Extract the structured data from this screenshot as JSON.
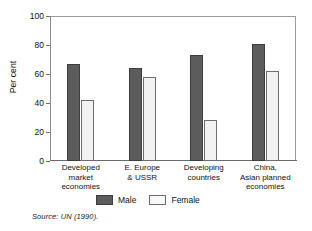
{
  "chart_data": {
    "type": "bar",
    "title": "",
    "subtitle": "",
    "xlabel": "",
    "ylabel": "Per cent",
    "ylim": [
      0,
      100
    ],
    "yticks": [
      0,
      20,
      40,
      60,
      80,
      100
    ],
    "grid": false,
    "legend_position": "bottom",
    "categories": [
      "Developed market economies",
      "E. Europe & USSR",
      "Developing countries",
      "China, Asian planned economies"
    ],
    "category_lines": [
      [
        "Developed",
        "market",
        "economies"
      ],
      [
        "E. Europe",
        "& USSR"
      ],
      [
        "Developing",
        "countries"
      ],
      [
        "China,",
        "Asian planned",
        "economies"
      ]
    ],
    "series": [
      {
        "name": "Male",
        "color": "#5c5c5c",
        "values": [
          67,
          64,
          73,
          81
        ]
      },
      {
        "name": "Female",
        "color": "#f2f2f2",
        "values": [
          42,
          58,
          28,
          62
        ]
      }
    ],
    "annotations": {
      "source": "Source: UN (1990)."
    }
  },
  "axis": {
    "y_tick_labels": [
      "100",
      "80",
      "60",
      "40",
      "20",
      "0"
    ],
    "y_title": "Per cent"
  },
  "legend": {
    "items": [
      {
        "label": "Male",
        "style": "male"
      },
      {
        "label": "Female",
        "style": "female"
      }
    ]
  },
  "footer": {
    "source": "Source: UN (1990)."
  }
}
